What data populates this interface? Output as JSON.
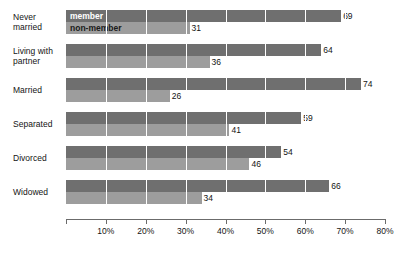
{
  "chart_data": {
    "type": "bar",
    "orientation": "horizontal",
    "title": "",
    "subtitle": "",
    "xlabel": "",
    "ylabel": "",
    "xlim": [
      0,
      80
    ],
    "grid": true,
    "legend_position": "inside-first-group",
    "categories": [
      "Never married",
      "Living with partner",
      "Married",
      "Separated",
      "Divorced",
      "Widowed"
    ],
    "category_lines": [
      [
        "Never",
        "married"
      ],
      [
        "Living with",
        "partner"
      ],
      [
        "Married",
        ""
      ],
      [
        "Separated",
        ""
      ],
      [
        "Divorced",
        ""
      ],
      [
        "Widowed",
        ""
      ]
    ],
    "series": [
      {
        "name": "member",
        "color": "#6f6f6f",
        "values": [
          69,
          64,
          74,
          59,
          54,
          66
        ]
      },
      {
        "name": "non-member",
        "color": "#9d9d9d",
        "values": [
          31,
          36,
          26,
          41,
          46,
          34
        ]
      }
    ],
    "xticks": [
      0,
      10,
      20,
      30,
      40,
      50,
      60,
      70,
      80
    ],
    "xtick_labels": [
      "",
      "10%",
      "20%",
      "30%",
      "40%",
      "50%",
      "60%",
      "70%",
      "80%"
    ],
    "value_labels": {
      "member": [
        "69",
        "64",
        "74",
        "59",
        "54",
        "66"
      ],
      "non_member": [
        "31",
        "36",
        "26",
        "41",
        "46",
        "34"
      ]
    },
    "legend": [
      {
        "label": "member",
        "color": "#6f6f6f"
      },
      {
        "label": "non-member",
        "color": "#9d9d9d"
      }
    ]
  }
}
